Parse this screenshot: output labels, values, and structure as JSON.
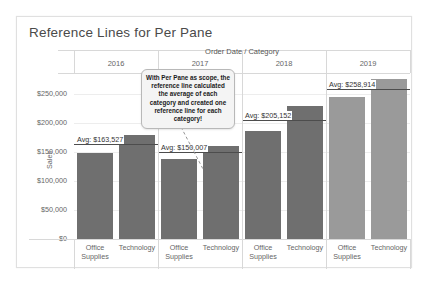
{
  "viz": {
    "title": "Reference Lines for Per Pane",
    "column_header_title": "Order Date / Category",
    "y_axis_title": "Sales"
  },
  "callout": {
    "text": "With Per Pane as scope, the reference line calculated the average of each category and created one reference line for each category!"
  },
  "axis": {
    "y_ticks": [
      "$250,000",
      "$200,000",
      "$150,000",
      "$100,000",
      "$50,000",
      "$0"
    ],
    "y_tick_values": [
      250000,
      200000,
      150000,
      100000,
      50000,
      0
    ]
  },
  "panes": [
    {
      "year": "2016",
      "ref_label": "Avg: $163,527",
      "ref_value": 163527,
      "bars": [
        {
          "category": "Office Supplies",
          "value": 148000
        },
        {
          "category": "Technology",
          "value": 179000
        }
      ]
    },
    {
      "year": "2017",
      "ref_label": "Avg: $150,007",
      "ref_value": 150007,
      "bars": [
        {
          "category": "Office Supplies",
          "value": 139000
        },
        {
          "category": "Technology",
          "value": 161000
        }
      ]
    },
    {
      "year": "2018",
      "ref_label": "Avg: $205,152",
      "ref_value": 205152,
      "bars": [
        {
          "category": "Office Supplies",
          "value": 186000
        },
        {
          "category": "Technology",
          "value": 229000
        }
      ]
    },
    {
      "year": "2019",
      "ref_label": "Avg: $258,914",
      "ref_value": 258914,
      "bars": [
        {
          "category": "Office Supplies",
          "value": 246000
        },
        {
          "category": "Technology",
          "value": 277000
        }
      ]
    }
  ],
  "chart_data": {
    "type": "bar",
    "title": "Reference Lines for Per Pane",
    "xlabel": "Order Date / Category",
    "ylabel": "Sales",
    "ylim": [
      0,
      285000
    ],
    "ytick_labels": [
      "$0",
      "$50,000",
      "$100,000",
      "$150,000",
      "$200,000",
      "$250,000"
    ],
    "grid": true,
    "legend": "none",
    "categories": [
      "2016 / Office Supplies",
      "2016 / Technology",
      "2017 / Office Supplies",
      "2017 / Technology",
      "2018 / Office Supplies",
      "2018 / Technology",
      "2019 / Office Supplies",
      "2019 / Technology"
    ],
    "values": [
      148000,
      179000,
      139000,
      161000,
      186000,
      229000,
      246000,
      277000
    ],
    "reference_lines": [
      {
        "pane": "2016",
        "label": "Avg: $163,527",
        "value": 163527
      },
      {
        "pane": "2017",
        "label": "Avg: $150,007",
        "value": 150007
      },
      {
        "pane": "2018",
        "label": "Avg: $205,152",
        "value": 205152
      },
      {
        "pane": "2019",
        "label": "Avg: $258,914",
        "value": 258914
      }
    ],
    "annotations": [
      "With Per Pane as scope, the reference line calculated the average of each category and created one reference line for each category!"
    ]
  }
}
